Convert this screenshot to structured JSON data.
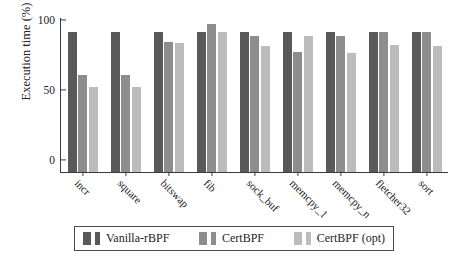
{
  "chart_data": {
    "type": "bar",
    "title": "",
    "xlabel": "",
    "ylabel": "Execution time (%)",
    "ylim": [
      0,
      110
    ],
    "yticks": [
      0,
      50,
      100
    ],
    "grid": false,
    "legend_position": "bottom",
    "categories": [
      "incr",
      "square",
      "bitswap",
      "fib",
      "sock_buf",
      "memcpy_1",
      "memcpy_n",
      "fletcher32",
      "sort"
    ],
    "series": [
      {
        "name": "Vanilla-rBPF",
        "color": "#595959",
        "values": [
          100,
          100,
          100,
          100,
          100,
          100,
          100,
          100,
          100
        ]
      },
      {
        "name": "CertBPF",
        "color": "#8d8d8d",
        "values": [
          69,
          69,
          93,
          106,
          97,
          86,
          97,
          100,
          100
        ]
      },
      {
        "name": "CertBPF (opt)",
        "color": "#bcbcbc",
        "values": [
          61,
          61,
          92,
          100,
          90,
          97,
          85,
          91,
          90
        ]
      }
    ]
  },
  "axis": {
    "y_title": "Execution time (%)",
    "y_tick_labels": [
      "100",
      "50",
      "0"
    ]
  },
  "legend": {
    "items": [
      {
        "label": "Vanilla-rBPF"
      },
      {
        "label": "CertBPF"
      },
      {
        "label": "CertBPF (opt)"
      }
    ]
  }
}
